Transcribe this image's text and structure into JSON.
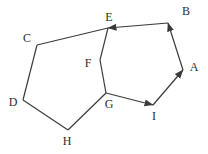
{
  "diagram": {
    "title": "",
    "background_color": "#ffffff",
    "stroke_color": "#3a3a3a",
    "label_color": "#2e2e2e",
    "stroke_width": 1.2,
    "arrowhead": {
      "length": 9,
      "width": 7
    },
    "nodes": [
      {
        "id": "A",
        "label": "A",
        "x": 183,
        "y": 70,
        "label_x": 194,
        "label_y": 67
      },
      {
        "id": "B",
        "label": "B",
        "x": 168,
        "y": 23,
        "label_x": 186,
        "label_y": 11
      },
      {
        "id": "C",
        "label": "C",
        "x": 37,
        "y": 45,
        "label_x": 27,
        "label_y": 38
      },
      {
        "id": "D",
        "label": "D",
        "x": 23,
        "y": 100,
        "label_x": 13,
        "label_y": 102
      },
      {
        "id": "E",
        "label": "E",
        "x": 108,
        "y": 28,
        "label_x": 109,
        "label_y": 17
      },
      {
        "id": "F",
        "label": "F",
        "x": 100,
        "y": 60,
        "label_x": 88,
        "label_y": 63
      },
      {
        "id": "G",
        "label": "G",
        "x": 106,
        "y": 93,
        "label_x": 109,
        "label_y": 104
      },
      {
        "id": "H",
        "label": "H",
        "x": 68,
        "y": 130,
        "label_x": 67,
        "label_y": 141
      },
      {
        "id": "I",
        "label": "I",
        "x": 153,
        "y": 105,
        "label_x": 154,
        "label_y": 116
      }
    ],
    "edges": [
      {
        "from": "C",
        "to": "E",
        "directed": false
      },
      {
        "from": "E",
        "to": "F",
        "directed": false
      },
      {
        "from": "F",
        "to": "G",
        "directed": false
      },
      {
        "from": "G",
        "to": "H",
        "directed": false
      },
      {
        "from": "H",
        "to": "D",
        "directed": false
      },
      {
        "from": "D",
        "to": "C",
        "directed": false
      },
      {
        "from": "G",
        "to": "I",
        "directed": true
      },
      {
        "from": "I",
        "to": "A",
        "directed": true
      },
      {
        "from": "A",
        "to": "B",
        "directed": true
      },
      {
        "from": "B",
        "to": "E",
        "directed": true
      }
    ]
  }
}
